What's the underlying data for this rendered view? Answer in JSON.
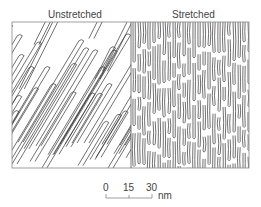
{
  "panels": [
    {
      "label": "Unstretched",
      "pattern": "diagonal-labyrinth-stripes"
    },
    {
      "label": "Stretched",
      "pattern": "vertical-labyrinth-stripes"
    }
  ],
  "scale_bar": {
    "ticks": [
      "0",
      "15",
      "30"
    ],
    "unit": "nm"
  },
  "colors": {
    "line": "#333333",
    "frame": "#888888",
    "background": "#ffffff"
  }
}
